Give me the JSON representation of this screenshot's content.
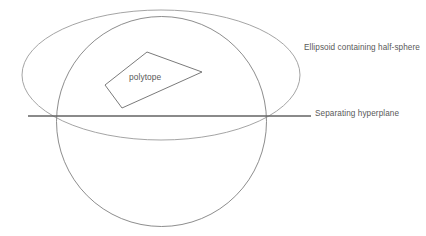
{
  "figure": {
    "background_color": "#ffffff",
    "width": 426,
    "height": 236
  },
  "labels": {
    "ellipsoid": "Ellipsoid containing half-sphere",
    "hyperplane": "Separating hyperplane",
    "polytope": "polytope"
  },
  "colors": {
    "circle_stroke": "#808080",
    "ellipse_stroke": "#9a9a9a",
    "hyperplane_stroke": "#636363",
    "polytope_stroke": "#6b6b6b",
    "text": "#595959"
  },
  "shapes": {
    "circle": {
      "name": "sphere",
      "cx": 161.5,
      "cy": 121.5,
      "r": 105,
      "stroke_width": 0.9
    },
    "ellipse": {
      "name": "ellipsoid-containing-half-sphere",
      "cx": 161,
      "cy": 75,
      "rx": 139,
      "ry": 65,
      "stroke_width": 0.9
    },
    "hyperplane": {
      "name": "separating-hyperplane",
      "x1": 28,
      "y1": 116,
      "x2": 311,
      "y2": 116,
      "stroke_width": 1.5
    },
    "polytope": {
      "name": "polytope",
      "points": "147,52 202,72 122,108 105,85",
      "stroke_width": 0.9
    }
  }
}
